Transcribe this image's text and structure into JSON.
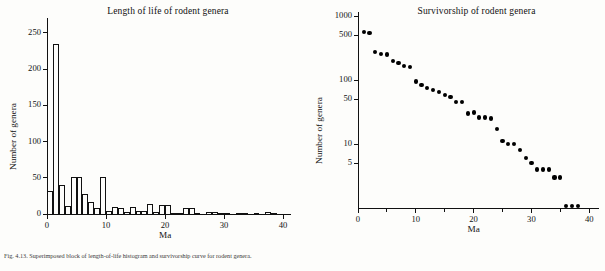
{
  "figure": {
    "caption": "Fig. 4.13. Superimposed block of length-of-life histogram and survivorship curve for rodent genera."
  },
  "chart_data": [
    {
      "type": "bar",
      "panel": "left",
      "title": "Length of life of rodent genera",
      "xlabel": "Ma",
      "ylabel": "Number of genera",
      "xlim": [
        0,
        41
      ],
      "ylim": [
        0,
        265
      ],
      "xticks": [
        0,
        10,
        20,
        30,
        40
      ],
      "yticks": [
        0,
        50,
        100,
        150,
        200,
        250
      ],
      "grid": false,
      "bin_width": 1,
      "categories": [
        0,
        1,
        2,
        3,
        4,
        5,
        6,
        7,
        8,
        9,
        10,
        11,
        12,
        13,
        14,
        15,
        16,
        17,
        18,
        19,
        20,
        21,
        22,
        23,
        24,
        25,
        26,
        27,
        28,
        29,
        30,
        31,
        32,
        33,
        34,
        35,
        36,
        37,
        38,
        39,
        40
      ],
      "values": [
        32,
        235,
        40,
        11,
        51,
        51,
        28,
        17,
        8,
        51,
        4,
        9,
        8,
        3,
        9,
        4,
        4,
        14,
        3,
        12,
        12,
        2,
        1,
        8,
        8,
        1,
        0,
        3,
        3,
        2,
        1,
        0,
        1,
        2,
        0,
        2,
        0,
        3,
        1,
        0,
        0
      ]
    },
    {
      "type": "scatter",
      "panel": "right",
      "title": "Survivorship of rodent genera",
      "xlabel": "Ma",
      "ylabel": "Number of genera",
      "yscale": "log",
      "xlim": [
        0,
        41
      ],
      "ylim": [
        1,
        1000
      ],
      "xticks": [
        0,
        10,
        20,
        30,
        40
      ],
      "xticks_minor": [
        5,
        15,
        25,
        35
      ],
      "yticks": [
        5,
        10,
        50,
        100,
        500,
        1000
      ],
      "grid": false,
      "x": [
        1,
        2,
        3,
        4,
        5,
        6,
        7,
        8,
        9,
        10,
        11,
        12,
        13,
        14,
        15,
        16,
        17,
        18,
        19,
        20,
        21,
        22,
        23,
        24,
        25,
        26,
        27,
        28,
        29,
        30,
        31,
        32,
        33,
        34,
        35,
        36,
        37,
        38
      ],
      "y": [
        560,
        540,
        270,
        255,
        250,
        200,
        185,
        165,
        160,
        95,
        83,
        74,
        70,
        65,
        58,
        55,
        45,
        45,
        30,
        31,
        26,
        26,
        25,
        17,
        11,
        10,
        10,
        8,
        6,
        5,
        4,
        4,
        4,
        3,
        3,
        1,
        1,
        1
      ]
    }
  ],
  "left_axis": {
    "title": "Length of life of rodent genera",
    "ylabel": "Number of genera",
    "xlabel": "Ma",
    "yticks": [
      "0",
      "50",
      "100",
      "150",
      "200",
      "250"
    ],
    "xticks": [
      "0",
      "10",
      "20",
      "30",
      "40"
    ]
  },
  "right_axis": {
    "title": "Survivorship of rodent genera",
    "ylabel": "Number of genera",
    "xlabel": "Ma",
    "yticks": [
      "5",
      "10",
      "50",
      "100",
      "500",
      "1000"
    ],
    "xticks": [
      "0",
      "10",
      "20",
      "30",
      "40"
    ]
  }
}
